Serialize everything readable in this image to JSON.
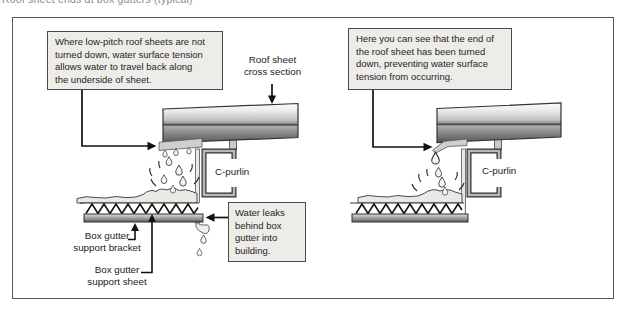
{
  "top_caption": "Roof sheet ends at box gutters (typical)",
  "colors": {
    "callout_bg": "#edece8",
    "callout_border": "#4a4a4a",
    "frame_border": "#585858",
    "ink": "#1e1e1e",
    "steel_dark": "#5f5f5f",
    "water_fill": "#e9e9e5"
  },
  "left_diagram": {
    "callout": "Where low-pitch roof sheets are not\nturned down, water surface tension\nallows water to travel back along\nthe underside of sheet.",
    "roof_sheet_label": "Roof sheet\ncross section",
    "c_purlin_label": "C-purlin",
    "leak_note": "Water leaks\nbehind box\ngutter into\nbuilding.",
    "bracket_label": "Box gutter\nsupport bracket",
    "sheet_label": "Box gutter\nsupport sheet"
  },
  "right_diagram": {
    "callout": "Here you can see that the end of\nthe roof sheet has been turned\ndown, preventing water surface\ntension from occurring.",
    "c_purlin_label": "C-purlin"
  }
}
